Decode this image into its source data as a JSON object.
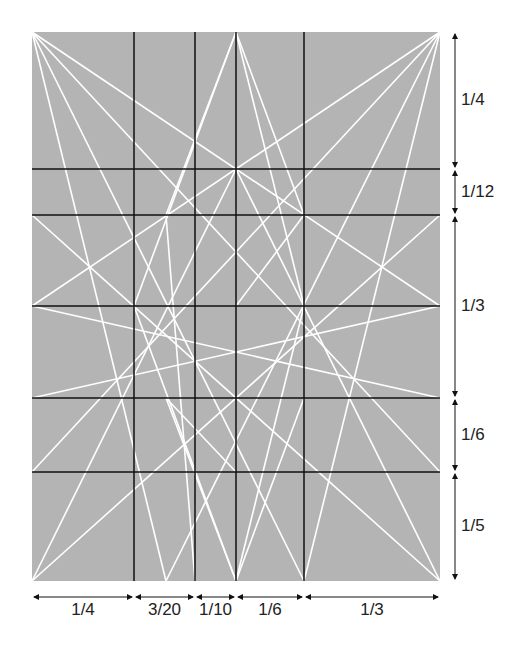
{
  "panel": {
    "x": 32,
    "y": 32,
    "w": 408,
    "h": 549,
    "fill": "#b4b4b4"
  },
  "vertical_lines": [
    134,
    195,
    236,
    304
  ],
  "horizontal_lines": [
    169,
    215,
    306,
    398,
    472
  ],
  "right_labels": [
    {
      "text": "1/4",
      "y": 100,
      "y0": 32,
      "y1": 169
    },
    {
      "text": "1/12",
      "y": 192,
      "y0": 169,
      "y1": 215
    },
    {
      "text": "1/3",
      "y": 306,
      "y0": 215,
      "y1": 398
    },
    {
      "text": "1/6",
      "y": 435,
      "y0": 398,
      "y1": 472
    },
    {
      "text": "1/5",
      "y": 526,
      "y0": 472,
      "y1": 581
    }
  ],
  "bottom_labels": [
    {
      "text": "1/4",
      "x0": 32,
      "x1": 134
    },
    {
      "text": "3/20",
      "x0": 134,
      "x1": 195
    },
    {
      "text": "1/10",
      "x0": 195,
      "x1": 236
    },
    {
      "text": "1/6",
      "x0": 236,
      "x1": 304
    },
    {
      "text": "1/3",
      "x0": 304,
      "x1": 440
    }
  ]
}
